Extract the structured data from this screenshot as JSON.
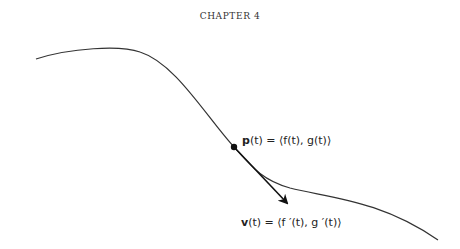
{
  "header": {
    "running_head": "CHAPTER 4"
  },
  "figure": {
    "point_label": {
      "bold": "p",
      "rest": "(t) = ⟨f(t), g(t)⟩"
    },
    "velocity_label": {
      "bold": "v",
      "rest": "(t) = ⟨f ′(t), g ′(t)⟩"
    },
    "colors": {
      "curve": "#333333",
      "vector": "#111111",
      "point": "#111111"
    }
  }
}
